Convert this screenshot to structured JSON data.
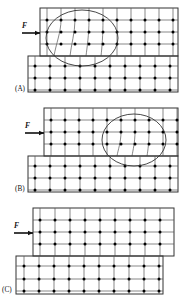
{
  "figure": {
    "title": "",
    "background_color": "#ffffff",
    "line_color": "#1a1a1a",
    "node_color": "#000000",
    "ellipse_color": "#2a2a2a",
    "canvas": {
      "width": 191,
      "height": 303
    }
  },
  "panels": [
    {
      "id": "A",
      "label": "(A)",
      "force": {
        "label": "F",
        "direction": "right"
      },
      "highlight_region": {
        "shape": "ellipse",
        "position": "left",
        "present": true
      },
      "slabs": [
        {
          "name": "upper-slab",
          "rows": 3,
          "cols": 10
        },
        {
          "name": "lower-slab",
          "rows": 3,
          "cols": 10
        }
      ]
    },
    {
      "id": "B",
      "label": "(B)",
      "force": {
        "label": "F",
        "direction": "right"
      },
      "highlight_region": {
        "shape": "ellipse",
        "position": "right",
        "present": true
      },
      "slabs": [
        {
          "name": "upper-slab",
          "rows": 3,
          "cols": 10
        },
        {
          "name": "lower-slab",
          "rows": 3,
          "cols": 10
        }
      ]
    },
    {
      "id": "C",
      "label": "(C)",
      "force": {
        "label": "F",
        "direction": "right"
      },
      "highlight_region": {
        "shape": "ellipse",
        "position": "none",
        "present": false
      },
      "slabs": [
        {
          "name": "upper-slab",
          "rows": 3,
          "cols": 10
        },
        {
          "name": "lower-slab",
          "rows": 3,
          "cols": 10
        }
      ]
    }
  ],
  "labels": {
    "panel_a": "(A)",
    "panel_b": "(B)",
    "panel_c": "(C)",
    "force_a": "F",
    "force_b": "F",
    "force_c": "F"
  }
}
